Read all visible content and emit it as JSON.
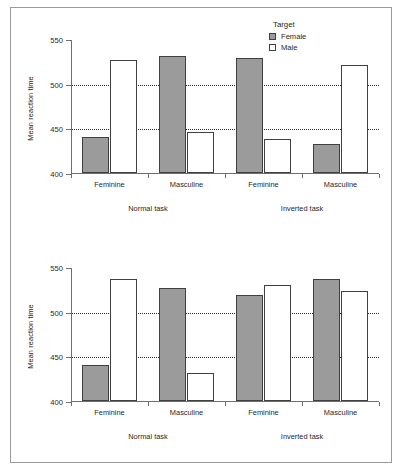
{
  "figure": {
    "panels": [
      {
        "name": "upper-panel",
        "ylabel": "Mean reaction time",
        "yticks": [
          "400",
          "450",
          "500",
          "550"
        ],
        "group_labels": [
          "Feminine",
          "Masculine",
          "Feminine",
          "Masculine"
        ],
        "task_labels": [
          "Normal task",
          "Inverted task"
        ],
        "legend": {
          "title": "Target",
          "entries": [
            {
              "label": "Female",
              "swatch": "female-swatch",
              "color": "#9b9b9b"
            },
            {
              "label": "Male",
              "swatch": "male-swatch",
              "color": "#ffffff"
            }
          ]
        }
      },
      {
        "name": "lower-panel",
        "ylabel": "Mean reaction time",
        "yticks": [
          "400",
          "450",
          "500",
          "550"
        ],
        "group_labels": [
          "Feminine",
          "Masculine",
          "Feminine",
          "Masculine"
        ],
        "task_labels": [
          "Normal task",
          "Inverted task"
        ]
      }
    ]
  },
  "chart_data": [
    {
      "type": "bar",
      "title": "",
      "panel": "upper",
      "xlabel": "",
      "ylabel": "Mean reaction time",
      "ylim": [
        400,
        550
      ],
      "yticks": [
        400,
        450,
        500,
        550
      ],
      "grid": "horizontal-dotted at 450 and 500",
      "legend_position": "top-right",
      "legend_title": "Target",
      "categories": [
        "Feminine",
        "Masculine",
        "Feminine",
        "Masculine"
      ],
      "group_spans": [
        {
          "label": "Normal task",
          "categories": [
            "Feminine",
            "Masculine"
          ]
        },
        {
          "label": "Inverted task",
          "categories": [
            "Feminine",
            "Masculine"
          ]
        }
      ],
      "series": [
        {
          "name": "Female",
          "color": "#9b9b9b",
          "values": [
            440,
            531,
            529,
            433
          ]
        },
        {
          "name": "Male",
          "color": "#ffffff",
          "values": [
            527,
            446,
            438,
            521
          ]
        }
      ]
    },
    {
      "type": "bar",
      "title": "",
      "panel": "lower",
      "xlabel": "",
      "ylabel": "Mean reaction time",
      "ylim": [
        400,
        550
      ],
      "yticks": [
        400,
        450,
        500,
        550
      ],
      "grid": "horizontal-dotted at 450 and 500",
      "legend_position": "none",
      "categories": [
        "Feminine",
        "Masculine",
        "Feminine",
        "Masculine"
      ],
      "group_spans": [
        {
          "label": "Normal task",
          "categories": [
            "Feminine",
            "Masculine"
          ]
        },
        {
          "label": "Inverted task",
          "categories": [
            "Feminine",
            "Masculine"
          ]
        }
      ],
      "series": [
        {
          "name": "Female",
          "color": "#9b9b9b",
          "values": [
            440,
            526,
            519,
            537
          ]
        },
        {
          "name": "Male",
          "color": "#ffffff",
          "values": [
            537,
            431,
            530,
            523
          ]
        }
      ]
    }
  ]
}
